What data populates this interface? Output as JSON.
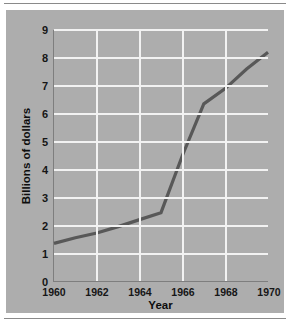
{
  "chart_data": {
    "type": "line",
    "title": "",
    "xlabel": "Year",
    "ylabel": "Billions of dollars",
    "x": [
      1960,
      1961,
      1962,
      1963,
      1964,
      1965,
      1966,
      1967,
      1968,
      1969,
      1970
    ],
    "values": [
      1.35,
      1.55,
      1.72,
      1.95,
      2.2,
      2.45,
      4.5,
      6.35,
      6.9,
      7.6,
      8.2
    ],
    "series": [
      {
        "name": "Billions of dollars",
        "values": [
          1.35,
          1.55,
          1.72,
          1.95,
          2.2,
          2.45,
          4.5,
          6.35,
          6.9,
          7.6,
          8.2
        ]
      }
    ],
    "xlim": [
      1960,
      1970
    ],
    "ylim": [
      0,
      9
    ],
    "y_ticks": [
      "0",
      "1",
      "2",
      "3",
      "4",
      "5",
      "6",
      "7",
      "8",
      "9"
    ],
    "y_tick_values": [
      0,
      1,
      2,
      3,
      4,
      5,
      6,
      7,
      8,
      9
    ],
    "x_ticks": [
      "1960",
      "1962",
      "1964",
      "1966",
      "1968",
      "1970"
    ],
    "x_tick_values": [
      1960,
      1962,
      1964,
      1966,
      1968,
      1970
    ],
    "grid": true,
    "legend": "none",
    "colors": {
      "plot_background": "#adadad",
      "gridline": "#f2f2f2",
      "line": "#585858",
      "axis": "#7e7e7e",
      "text": "#111111",
      "figure_background": "#ffffff"
    }
  }
}
